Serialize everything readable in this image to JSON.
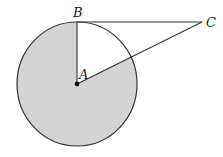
{
  "diagram": {
    "title": "",
    "points": [
      {
        "id": "A",
        "label": "A",
        "x": 77,
        "y": 84,
        "role": "circle-center"
      },
      {
        "id": "B",
        "label": "B",
        "x": 77,
        "y": 22,
        "role": "point-on-circle"
      },
      {
        "id": "C",
        "label": "C",
        "x": 202,
        "y": 22,
        "role": "external-point"
      }
    ],
    "circle": {
      "center": "A",
      "rx": 60,
      "ry": 62
    },
    "segments": [
      [
        "A",
        "B"
      ],
      [
        "B",
        "C"
      ],
      [
        "A",
        "C"
      ]
    ],
    "shaded_region": "major sector of circle bounded by radius AB and segment AC",
    "colors": {
      "shade": "#d4d4d4",
      "stroke": "#333333",
      "background": "#ffffff"
    }
  },
  "labels": {
    "A": "A",
    "B": "B",
    "C": "C"
  }
}
